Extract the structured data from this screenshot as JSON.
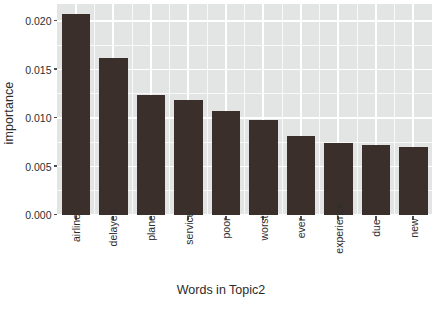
{
  "chart_data": {
    "type": "bar",
    "title": "",
    "xlabel": "Words in Topic2",
    "ylabel": "importance",
    "categories": [
      "airline",
      "delayed",
      "plane",
      "service",
      "poor",
      "worst",
      "ever",
      "experience",
      "due",
      "new"
    ],
    "values": [
      0.0207,
      0.0162,
      0.0124,
      0.0119,
      0.0107,
      0.0098,
      0.0081,
      0.0074,
      0.0072,
      0.007
    ],
    "ylim": [
      0.0,
      0.0215
    ],
    "yticks": [
      0.0,
      0.005,
      0.01,
      0.015,
      0.02
    ],
    "ytick_labels": [
      "0.000",
      "0.005",
      "0.010",
      "0.015",
      "0.020"
    ],
    "grid": true,
    "legend": "none",
    "bar_color": "#3b2f2b",
    "panel_color": "#e3e5e5",
    "gridline_color": "#ffffff"
  },
  "axis": {
    "y_title": "importance",
    "x_title": "Words in Topic2"
  }
}
